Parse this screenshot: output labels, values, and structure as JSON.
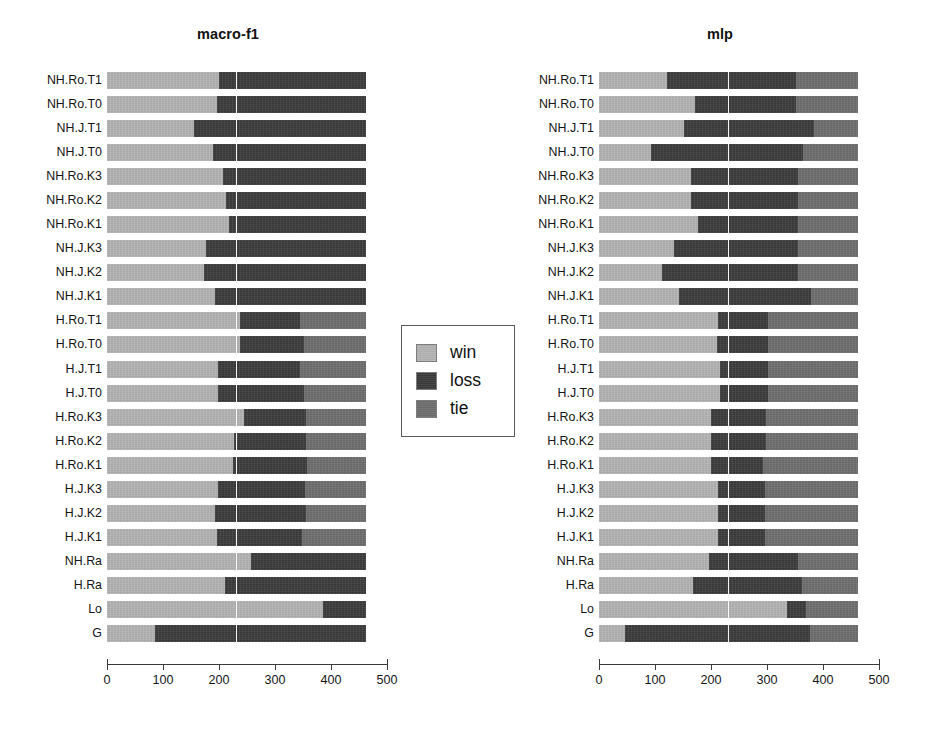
{
  "figure": {
    "background": "#ffffff",
    "width": 936,
    "height": 730
  },
  "legend": {
    "position": "center-between-panels",
    "items": [
      {
        "label": "win",
        "color": "#b4b4b4",
        "swatch_name": "legend-swatch-win"
      },
      {
        "label": "loss",
        "color": "#3b3b3b",
        "swatch_name": "legend-swatch-loss"
      },
      {
        "label": "tie",
        "color": "#6e6e6e",
        "swatch_name": "legend-swatch-tie"
      }
    ]
  },
  "axis": {
    "ticks": [
      "0",
      "100",
      "200",
      "300",
      "400",
      "500"
    ],
    "tick_values": [
      0,
      100,
      200,
      300,
      400,
      500
    ],
    "xlim": [
      0,
      500
    ],
    "gridline_value": 230
  },
  "categories": [
    "NH.Ro.T1",
    "NH.Ro.T0",
    "NH.J.T1",
    "NH.J.T0",
    "NH.Ro.K3",
    "NH.Ro.K2",
    "NH.Ro.K1",
    "NH.J.K3",
    "NH.J.K2",
    "NH.J.K1",
    "H.Ro.T1",
    "H.Ro.T0",
    "H.J.T1",
    "H.J.T0",
    "H.Ro.K3",
    "H.Ro.K2",
    "H.Ro.K1",
    "H.J.K3",
    "H.J.K2",
    "H.J.K1",
    "NH.Ra",
    "H.Ra",
    "Lo",
    "G"
  ],
  "chart_data": [
    {
      "type": "bar",
      "orientation": "horizontal",
      "stacked": true,
      "title": "macro-f1",
      "xlabel": "",
      "ylabel": "",
      "xlim": [
        0,
        500
      ],
      "grid": true,
      "legend_position": "center",
      "categories": [
        "NH.Ro.T1",
        "NH.Ro.T0",
        "NH.J.T1",
        "NH.J.T0",
        "NH.Ro.K3",
        "NH.Ro.K2",
        "NH.Ro.K1",
        "NH.J.K3",
        "NH.J.K2",
        "NH.J.K1",
        "H.Ro.T1",
        "H.Ro.T0",
        "H.J.T1",
        "H.J.T0",
        "H.Ro.K3",
        "H.Ro.K2",
        "H.Ro.K1",
        "H.J.K3",
        "H.J.K2",
        "H.J.K1",
        "NH.Ra",
        "H.Ra",
        "Lo",
        "G"
      ],
      "series": [
        {
          "name": "win",
          "color": "#b4b4b4",
          "values": [
            200,
            196,
            155,
            190,
            207,
            213,
            218,
            176,
            174,
            192,
            237,
            238,
            199,
            198,
            245,
            226,
            225,
            198,
            193,
            196,
            258,
            210,
            386,
            85
          ]
        },
        {
          "name": "loss",
          "color": "#3b3b3b",
          "values": [
            262,
            266,
            307,
            272,
            255,
            249,
            244,
            286,
            288,
            270,
            108,
            113,
            146,
            153,
            110,
            129,
            132,
            155,
            162,
            152,
            204,
            252,
            76,
            377
          ]
        },
        {
          "name": "tie",
          "color": "#6e6e6e",
          "values": [
            0,
            0,
            0,
            0,
            0,
            0,
            0,
            0,
            0,
            0,
            117,
            111,
            117,
            111,
            107,
            107,
            105,
            109,
            107,
            114,
            0,
            0,
            0,
            0
          ]
        }
      ]
    },
    {
      "type": "bar",
      "orientation": "horizontal",
      "stacked": true,
      "title": "mlp",
      "xlabel": "",
      "ylabel": "",
      "xlim": [
        0,
        500
      ],
      "grid": true,
      "categories": [
        "NH.Ro.T1",
        "NH.Ro.T0",
        "NH.J.T1",
        "NH.J.T0",
        "NH.Ro.K3",
        "NH.Ro.K2",
        "NH.Ro.K1",
        "NH.J.K3",
        "NH.J.K2",
        "NH.J.K1",
        "H.Ro.T1",
        "H.Ro.T0",
        "H.J.T1",
        "H.J.T0",
        "H.Ro.K3",
        "H.Ro.K2",
        "H.Ro.K1",
        "H.J.K3",
        "H.J.K2",
        "H.J.K1",
        "NH.Ra",
        "H.Ra",
        "Lo",
        "G"
      ],
      "series": [
        {
          "name": "win",
          "color": "#b4b4b4",
          "values": [
            122,
            172,
            152,
            93,
            165,
            165,
            177,
            134,
            112,
            143,
            213,
            211,
            216,
            216,
            200,
            200,
            200,
            212,
            212,
            212,
            196,
            168,
            335,
            47
          ]
        },
        {
          "name": "loss",
          "color": "#3b3b3b",
          "values": [
            230,
            180,
            232,
            271,
            190,
            190,
            178,
            222,
            243,
            235,
            88,
            90,
            85,
            85,
            98,
            98,
            93,
            85,
            85,
            85,
            160,
            194,
            35,
            329
          ]
        },
        {
          "name": "tie",
          "color": "#6e6e6e",
          "values": [
            110,
            110,
            78,
            98,
            107,
            107,
            107,
            106,
            107,
            84,
            161,
            161,
            161,
            161,
            164,
            164,
            169,
            165,
            165,
            165,
            106,
            100,
            92,
            86
          ]
        }
      ]
    }
  ]
}
